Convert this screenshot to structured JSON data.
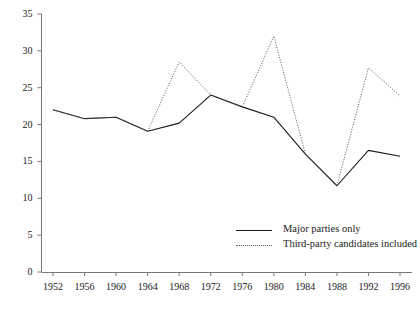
{
  "chart_data": {
    "type": "line",
    "title": "",
    "subtitle": "",
    "xlabel": "",
    "ylabel": "",
    "categories": [
      "1952",
      "1956",
      "1960",
      "1964",
      "1968",
      "1972",
      "1976",
      "1980",
      "1984",
      "1988",
      "1992",
      "1996"
    ],
    "x": [
      1952,
      1956,
      1960,
      1964,
      1968,
      1972,
      1976,
      1980,
      1984,
      1988,
      1992,
      1996
    ],
    "xlim": [
      1950,
      1998
    ],
    "ylim": [
      0,
      35
    ],
    "yticks": [
      0,
      5,
      10,
      15,
      20,
      25,
      30,
      35
    ],
    "ytick_labels": [
      "0",
      "5",
      "10",
      "15",
      "20",
      "25",
      "30",
      "35"
    ],
    "xtick_labels": [
      "1952",
      "1956",
      "1960",
      "1964",
      "1968",
      "1972",
      "1976",
      "1980",
      "1984",
      "1988",
      "1992",
      "1996"
    ],
    "grid": false,
    "legend_position": "inside lower right",
    "series": [
      {
        "name": "Major parties only",
        "style": "solid",
        "color": "#1a1a1a",
        "values": [
          22.0,
          20.8,
          21.0,
          19.1,
          20.2,
          24.0,
          22.4,
          21.0,
          16.0,
          11.7,
          16.5,
          15.7
        ]
      },
      {
        "name": "Third-party candidates included",
        "style": "dotted",
        "color": "#555555",
        "values": [
          22.0,
          20.8,
          21.0,
          19.1,
          28.5,
          24.0,
          22.4,
          32.0,
          16.0,
          11.7,
          27.7,
          23.9
        ]
      }
    ]
  },
  "legend": {
    "items": [
      {
        "label": "Major parties only",
        "style": "solid"
      },
      {
        "label": "Third-party candidates included",
        "style": "dotted"
      }
    ]
  },
  "axes": {
    "axis_color": "#777777"
  }
}
